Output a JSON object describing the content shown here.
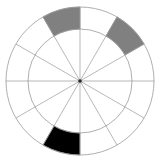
{
  "chart_data": {
    "type": "pie",
    "title": "",
    "subtitle": "",
    "xlabel": "",
    "ylabel": "",
    "variant": "polar-sector-rose",
    "legend_position": "none",
    "grid": true,
    "sector_count": 12,
    "sector_angle_deg": 30,
    "ring_count": 2,
    "ring_radii_px": [
      52,
      74
    ],
    "center_px": [
      80,
      81
    ],
    "axis_ranges": {
      "theta_deg": [
        0,
        360
      ],
      "r_px": [
        0,
        74
      ]
    },
    "categories": [
      "S0",
      "S1",
      "S2",
      "S3",
      "S4",
      "S5",
      "S6",
      "S7",
      "S8",
      "S9",
      "S10",
      "S11"
    ],
    "tick_labels": [],
    "annotations": [],
    "colors": {
      "background": "#ffffff",
      "grid": "#9a9a9a",
      "empty_sector": "#ffffff",
      "gray_sector": "#808080",
      "black_sector": "#000000",
      "center_dot": "#2b2b2b"
    },
    "series": [
      {
        "name": "outer-ring-fill",
        "ring": "outer",
        "inner_radius_px": 52,
        "outer_radius_px": 74,
        "values": [
          0,
          0,
          0,
          1,
          0,
          1,
          0,
          0,
          0,
          0,
          2,
          0
        ],
        "value_colors": {
          "0": "#ffffff",
          "1": "#808080",
          "2": "#000000"
        }
      },
      {
        "name": "inner-ring-fill",
        "ring": "inner",
        "inner_radius_px": 0,
        "outer_radius_px": 52,
        "values": [
          0,
          0,
          0,
          0,
          0,
          0,
          0,
          0,
          0,
          0,
          0,
          0
        ],
        "value_colors": {
          "0": "#ffffff"
        }
      }
    ],
    "highlighted_sectors": [
      {
        "label": "upper-right-gray",
        "center_angle_deg": 45,
        "ring": "outer",
        "fill": "#808080"
      },
      {
        "label": "upper-left-gray",
        "center_angle_deg": 135,
        "ring": "outer",
        "fill": "#808080"
      },
      {
        "label": "bottom-black",
        "center_angle_deg": 270,
        "ring": "outer",
        "fill": "#000000"
      }
    ]
  }
}
